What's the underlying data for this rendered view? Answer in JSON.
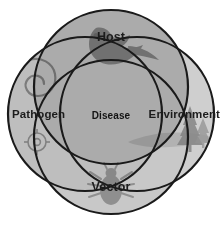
{
  "diagram": {
    "type": "four-set-venn",
    "title_visible": false,
    "background_color": "#ffffff",
    "stroke_color": "#1a1a1a",
    "stroke_width": 2.2,
    "center_label": {
      "text": "Disease",
      "name": "disease-center-label"
    },
    "sets": [
      {
        "key": "host",
        "label": "Host",
        "position": "top",
        "fill_color": "#8f8f8f",
        "motif": "bird-silhouette",
        "motif_color": "#7d7d7d",
        "cx": 111,
        "cy": 87,
        "r": 77
      },
      {
        "key": "pathogen",
        "label": "Pathogen",
        "position": "left",
        "fill_color": "#b4b4b4",
        "motif": "spirochete-spiral",
        "motif_color": "#a3a3a3",
        "cx": 85,
        "cy": 114,
        "r": 77
      },
      {
        "key": "environment",
        "label": "Environment",
        "position": "right",
        "fill_color": "#cfcfcf",
        "motif": "pine-tree-landscape",
        "motif_color": "#b0b0b0",
        "cx": 137,
        "cy": 114,
        "r": 77
      },
      {
        "key": "vector",
        "label": "Vector",
        "position": "bottom",
        "fill_color": "#c4c4c4",
        "motif": "tick-silhouette",
        "motif_color": "#b2b2b2",
        "cx": 111,
        "cy": 137,
        "r": 77
      }
    ]
  }
}
